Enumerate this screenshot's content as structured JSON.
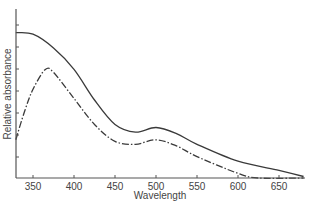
{
  "chart_data": {
    "type": "line",
    "title": "",
    "xlabel": "Wavelength",
    "ylabel": "Relative absorbance",
    "xlim": [
      329,
      682
    ],
    "ylim": [
      0,
      1.1
    ],
    "x_ticks": [
      350,
      400,
      450,
      500,
      550,
      600,
      650
    ],
    "y_ticks_unlabeled": 7,
    "grid": false,
    "legend": null,
    "series": [
      {
        "name": "solid",
        "style": "solid",
        "x": [
          329,
          350,
          375,
          400,
          425,
          450,
          475,
          500,
          525,
          550,
          600,
          650,
          680
        ],
        "y": [
          0.95,
          0.94,
          0.85,
          0.71,
          0.51,
          0.35,
          0.3,
          0.33,
          0.29,
          0.22,
          0.11,
          0.05,
          0.01
        ]
      },
      {
        "name": "dash-dot",
        "style": "dash-dot",
        "x": [
          329,
          340,
          350,
          365,
          375,
          400,
          425,
          450,
          475,
          500,
          525,
          550,
          600,
          625,
          680
        ],
        "y": [
          0.25,
          0.44,
          0.58,
          0.71,
          0.69,
          0.52,
          0.35,
          0.24,
          0.22,
          0.25,
          0.21,
          0.14,
          0.03,
          0.0,
          0.0
        ]
      }
    ]
  },
  "axes": {
    "x_title": "Wavelength",
    "y_title": "Relative absorbance"
  },
  "colors": {
    "line": "#3a3a3a",
    "axis": "#555555"
  }
}
